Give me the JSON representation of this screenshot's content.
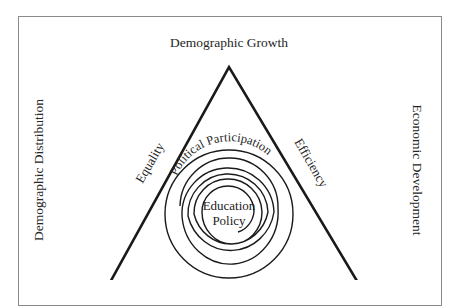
{
  "diagram": {
    "type": "triangle-with-spiral",
    "top_label": "Demographic Growth",
    "left_label": "Demographic Distribution",
    "right_label": "Economic Development",
    "triangle_sides": {
      "left": "Equality",
      "right": "Efficiency"
    },
    "spiral": {
      "arc_label": "Political Participation",
      "core_label_line1": "Education",
      "core_label_line2": "Policy"
    },
    "colors": {
      "stroke": "#1a1a1a",
      "frame": "#8a8a8a",
      "text": "#262626",
      "background": "#ffffff"
    }
  }
}
